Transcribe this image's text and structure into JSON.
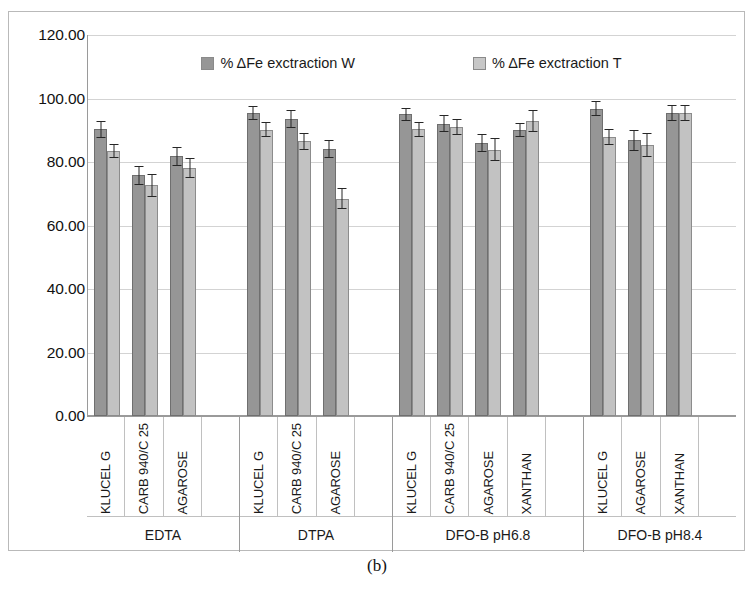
{
  "caption": "(b)",
  "legend": {
    "position": "top-center",
    "items": [
      {
        "label": "% ΔFe exctraction W",
        "color": "#969696",
        "key": "W"
      },
      {
        "label": "% ΔFe exctraction T",
        "color": "#c7c7c7",
        "key": "T"
      }
    ]
  },
  "chart_data": {
    "type": "bar",
    "title": "",
    "xlabel": "",
    "ylabel": "",
    "ylim": [
      0,
      120
    ],
    "ytick_step": 20,
    "ytick_labels": [
      "120.00",
      "100.00",
      "80.00",
      "60.00",
      "40.00",
      "20.00",
      "0.00"
    ],
    "grid": true,
    "error_bars": true,
    "group_labels": [
      "EDTA",
      "DTPA",
      "DFO-B pH6.8",
      "DFO-B pH8.4"
    ],
    "categories": [
      "KLUCEL G",
      "CARB 940/C 25",
      "AGAROSE",
      "",
      "KLUCEL G",
      "CARB 940/C 25",
      "AGAROSE",
      "",
      "KLUCEL G",
      "CARB 940/C 25",
      "AGAROSE",
      "XANTHAN",
      "",
      "KLUCEL G",
      "AGAROSE",
      "XANTHAN",
      ""
    ],
    "groups": [
      {
        "label": "EDTA",
        "slots": [
          {
            "category": "KLUCEL G",
            "W": 90.3,
            "W_err": 2.6,
            "T": 83.4,
            "T_err": 2.2
          },
          {
            "category": "CARB 940/C 25",
            "W": 75.8,
            "W_err": 3.0,
            "T": 72.7,
            "T_err": 3.6
          },
          {
            "category": "AGAROSE",
            "W": 81.8,
            "W_err": 3.0,
            "T": 78.2,
            "T_err": 3.1
          },
          {
            "category": "",
            "W": null,
            "W_err": null,
            "T": null,
            "T_err": null
          }
        ]
      },
      {
        "label": "DTPA",
        "slots": [
          {
            "category": "KLUCEL G",
            "W": 95.5,
            "W_err": 2.2,
            "T": 90.2,
            "T_err": 2.3
          },
          {
            "category": "CARB 940/C 25",
            "W": 93.5,
            "W_err": 2.8,
            "T": 86.5,
            "T_err": 2.6
          },
          {
            "category": "AGAROSE",
            "W": 84.0,
            "W_err": 2.8,
            "T": 68.5,
            "T_err": 3.2
          },
          {
            "category": "",
            "W": null,
            "W_err": null,
            "T": null,
            "T_err": null
          }
        ]
      },
      {
        "label": "DFO-B pH6.8",
        "slots": [
          {
            "category": "KLUCEL G",
            "W": 95.0,
            "W_err": 2.0,
            "T": 90.3,
            "T_err": 2.4
          },
          {
            "category": "CARB 940/C 25",
            "W": 92.1,
            "W_err": 2.7,
            "T": 91.0,
            "T_err": 2.6
          },
          {
            "category": "AGAROSE",
            "W": 85.9,
            "W_err": 2.8,
            "T": 83.9,
            "T_err": 3.6
          },
          {
            "category": "XANTHAN",
            "W": 90.1,
            "W_err": 2.2,
            "T": 92.8,
            "T_err": 3.5
          },
          {
            "category": "",
            "W": null,
            "W_err": null,
            "T": null,
            "T_err": null
          }
        ]
      },
      {
        "label": "DFO-B pH8.4",
        "slots": [
          {
            "category": "KLUCEL G",
            "W": 96.8,
            "W_err": 2.3,
            "T": 87.8,
            "T_err": 2.5
          },
          {
            "category": "AGAROSE",
            "W": 86.8,
            "W_err": 3.3,
            "T": 85.3,
            "T_err": 3.8
          },
          {
            "category": "XANTHAN",
            "W": 95.4,
            "W_err": 2.5,
            "T": 95.4,
            "T_err": 2.6
          },
          {
            "category": "",
            "W": null,
            "W_err": null,
            "T": null,
            "T_err": null
          }
        ]
      }
    ]
  }
}
